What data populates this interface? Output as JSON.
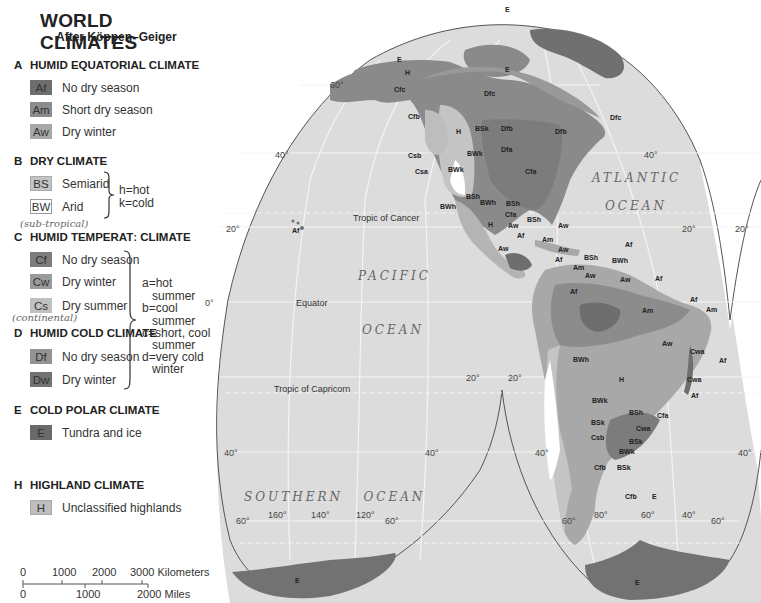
{
  "legend": {
    "title": "WORLD CLIMATES",
    "subtitle": "After Köppen–Geiger",
    "groups": [
      {
        "letter": "A",
        "heading": "HUMID EQUATORIAL CLIMATE",
        "items": [
          {
            "code": "Af",
            "label": "No dry season",
            "color": "#6e6e6e"
          },
          {
            "code": "Am",
            "label": "Short dry season",
            "color": "#8c8c8c"
          },
          {
            "code": "Aw",
            "label": "Dry winter",
            "color": "#a8a8a8"
          }
        ]
      },
      {
        "letter": "B",
        "heading": "DRY CLIMATE",
        "items": [
          {
            "code": "BS",
            "label": "Semiarid",
            "color": "#c4c4c4"
          },
          {
            "code": "BW",
            "label": "Arid",
            "color": "#ffffff"
          }
        ],
        "note": [
          "h=hot",
          "k=cold"
        ]
      },
      {
        "letter": "C",
        "heading": "HUMID TEMPERATː CLIMATE",
        "handwritten": "(sub-tropical)",
        "items": [
          {
            "code": "Cf",
            "label": "No dry season",
            "color": "#7d7d7d"
          },
          {
            "code": "Cw",
            "label": "Dry winter",
            "color": "#9a9a9a"
          },
          {
            "code": "Cs",
            "label": "Dry summer",
            "color": "#c0c0c0"
          }
        ]
      },
      {
        "letter": "D",
        "heading": "HUMID COLD CLIMATE",
        "handwritten": "(continental)",
        "items": [
          {
            "code": "Df",
            "label": "No dry season",
            "color": "#939393"
          },
          {
            "code": "Dw",
            "label": "Dry winter",
            "color": "#727272"
          }
        ]
      },
      {
        "letter": "E",
        "heading": "COLD POLAR CLIMATE",
        "items": [
          {
            "code": "E",
            "label": "Tundra and ice",
            "color": "#6a6a6a"
          }
        ]
      },
      {
        "letter": "H",
        "heading": "HIGHLAND CLIMATE",
        "items": [
          {
            "code": "H",
            "label": "Unclassified highlands",
            "color": "#bdbdbd"
          }
        ]
      }
    ],
    "cd_note": [
      "a=hot",
      "  summer",
      "b=cool",
      "  summer",
      "c=short, cool",
      "  summer",
      "d=very cold",
      "  winter"
    ]
  },
  "scale": {
    "km_ticks": [
      "0",
      "1000",
      "2000",
      "3000 Kilometers"
    ],
    "mi_ticks": [
      "0",
      "1000",
      "2000 Miles"
    ]
  },
  "map": {
    "oceans": [
      "PACIFIC",
      "OCEAN",
      "ATLANTIC",
      "OCEAN",
      "SOUTHERN   OCEAN"
    ],
    "reference_lines": [
      "Tropic of Cancer",
      "Equator",
      "Tropic of Capricorn"
    ],
    "degree_labels": [
      "60°",
      "40°",
      "40°",
      "20°",
      "20°",
      "20°",
      "20°",
      "0°",
      "20°",
      "20°",
      "40°",
      "40°",
      "40°",
      "40°",
      "60°",
      "60°",
      "60°",
      "60°",
      "160°",
      "140°",
      "120°",
      "80°",
      "60°",
      "40°"
    ],
    "region_labels": {
      "north_america": [
        "E",
        "E",
        "E",
        "H",
        "Cfc",
        "Dfc",
        "Dfc",
        "Cfb",
        "H",
        "BSk",
        "Dfb",
        "Dfb",
        "Dfa",
        "Csb",
        "BWk",
        "Csa",
        "BWk",
        "Cfa",
        "BSh",
        "BWh",
        "BWh",
        "BSh",
        "Cfa",
        "H",
        "Aw",
        "BSh",
        "Aw",
        "Af",
        "Am",
        "Aw",
        "Af",
        "Aw"
      ],
      "pacific": [
        "Af"
      ],
      "south_america": [
        "Am",
        "BSh",
        "BWh",
        "Aw",
        "Af",
        "Af",
        "Am",
        "Af",
        "Aw",
        "Am",
        "Af",
        "Aw",
        "Cwa",
        "Af",
        "Cwa",
        "Af",
        "BWh",
        "H",
        "BWk",
        "BSh",
        "Cfa",
        "BSk",
        "Cwa",
        "Csb",
        "BSk",
        "BWk",
        "Cfb",
        "BSk",
        "Cfb",
        "E"
      ],
      "antarctica": [
        "E",
        "E"
      ]
    }
  }
}
